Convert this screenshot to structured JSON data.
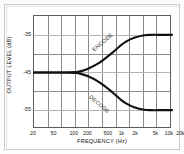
{
  "chart_data": {
    "type": "line",
    "title": "",
    "xlabel": "FREQUENCY (Hz)",
    "ylabel": "OUTPUT LEVEL (dB)",
    "xscale": "log",
    "xlim": [
      20,
      20000
    ],
    "ylim": [
      -60,
      -30
    ],
    "grid": true,
    "legend_position": "inline-curve-labels",
    "xticks": [
      {
        "value": 20,
        "label": "20"
      },
      {
        "value": 50,
        "label": "50"
      },
      {
        "value": 100,
        "label": "100"
      },
      {
        "value": 200,
        "label": "200"
      },
      {
        "value": 500,
        "label": "500"
      },
      {
        "value": 1000,
        "label": "1k"
      },
      {
        "value": 2000,
        "label": "2k"
      },
      {
        "value": 5000,
        "label": "5k"
      },
      {
        "value": 10000,
        "label": "10k"
      },
      {
        "value": 20000,
        "label": "20k"
      }
    ],
    "yticks": [
      {
        "value": -35,
        "label": "-35"
      },
      {
        "value": -45,
        "label": "-45"
      },
      {
        "value": -55,
        "label": "-55"
      }
    ],
    "series": [
      {
        "name": "ENCODE",
        "label": "ENCODE",
        "color": "#111111",
        "x": [
          20,
          50,
          100,
          150,
          200,
          300,
          500,
          700,
          1000,
          1500,
          2000,
          3000,
          5000,
          7000,
          10000,
          15000,
          20000
        ],
        "y": [
          -45.0,
          -45.0,
          -45.0,
          -44.9,
          -44.7,
          -44.0,
          -42.6,
          -41.3,
          -39.8,
          -37.9,
          -36.8,
          -35.8,
          -35.1,
          -35.0,
          -35.0,
          -35.0,
          -35.0
        ]
      },
      {
        "name": "DECODE",
        "label": "DECODE",
        "color": "#111111",
        "x": [
          20,
          50,
          100,
          150,
          200,
          300,
          500,
          700,
          1000,
          1500,
          2000,
          3000,
          5000,
          7000,
          10000,
          15000,
          20000
        ],
        "y": [
          -45.0,
          -45.0,
          -45.0,
          -45.1,
          -45.3,
          -46.0,
          -47.4,
          -48.7,
          -50.2,
          -52.1,
          -53.2,
          -54.2,
          -54.9,
          -55.0,
          -55.0,
          -55.0,
          -55.0
        ]
      }
    ]
  },
  "chart": {
    "xaxis_title": "FREQUENCY (Hz)",
    "yaxis_title": "OUTPUT LEVEL (dB)",
    "encode_label": "ENCODE",
    "decode_label": "DECODE",
    "xticks": [
      "20",
      "50",
      "100",
      "200",
      "500",
      "1k",
      "2k",
      "5k",
      "10k",
      "20k"
    ],
    "yticks": [
      "-35",
      "-45",
      "-55"
    ],
    "colors": {
      "curve": "#111111",
      "grid": "#8a8a8a",
      "axis": "#5b5b5b",
      "frame": "#c9c9c9",
      "background": "#ffffff",
      "text": "#1a1a1a"
    }
  }
}
